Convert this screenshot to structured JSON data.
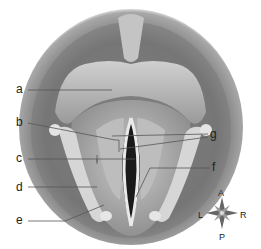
{
  "diagram": {
    "labels": [
      {
        "id": "a",
        "text": "a"
      },
      {
        "id": "b",
        "text": "b"
      },
      {
        "id": "c",
        "text": "c"
      },
      {
        "id": "d",
        "text": "d"
      },
      {
        "id": "e",
        "text": "e"
      },
      {
        "id": "f",
        "text": "f"
      },
      {
        "id": "g",
        "text": "g"
      }
    ],
    "compass": {
      "top": "A",
      "bottom": "P",
      "left": "L",
      "right": "R"
    }
  }
}
